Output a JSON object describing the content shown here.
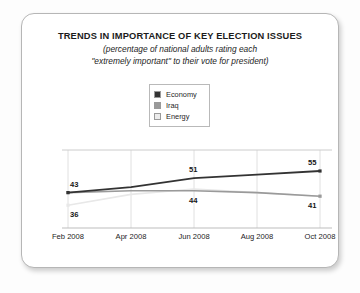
{
  "card": {
    "title": "TRENDS IN IMPORTANCE OF KEY ELECTION ISSUES",
    "subtitle_line1": "(percentage of national adults rating each",
    "subtitle_line2": "\"extremely important\" to their vote for president)"
  },
  "colors": {
    "economy": "#333333",
    "iraq": "#9a9a9a",
    "energy": "#e8e8e8",
    "gridline": "#e0e0e0",
    "axis": "#cccccc",
    "card_border": "#b6b6b6",
    "text": "#1b1b1b"
  },
  "chart_data": {
    "type": "line",
    "title": "TRENDS IN IMPORTANCE OF KEY ELECTION ISSUES",
    "subtitle": "(percentage of national adults rating each \"extremely important\" to their vote for president)",
    "xlabel": "",
    "ylabel": "",
    "ylim": [
      30,
      60
    ],
    "grid": true,
    "legend_position": "top-center",
    "categories": [
      "Feb 2008",
      "Apr 2008",
      "Jun 2008",
      "Aug 2008",
      "Oct 2008"
    ],
    "series": [
      {
        "name": "Economy",
        "color": "#333333",
        "values": [
          43,
          46,
          51,
          53,
          55
        ]
      },
      {
        "name": "Iraq",
        "color": "#9a9a9a",
        "values": [
          43,
          44,
          44,
          43,
          41
        ]
      },
      {
        "name": "Energy",
        "color": "#e8e8e8",
        "values": [
          36,
          42,
          45,
          43,
          41
        ]
      }
    ],
    "point_labels": [
      {
        "text": "43",
        "series": "Economy",
        "category": "Feb 2008",
        "position": "above"
      },
      {
        "text": "36",
        "series": "Energy",
        "category": "Feb 2008",
        "position": "below"
      },
      {
        "text": "51",
        "series": "Economy",
        "category": "Jun 2008",
        "position": "above"
      },
      {
        "text": "44",
        "series": "Iraq",
        "category": "Jun 2008",
        "position": "below"
      },
      {
        "text": "55",
        "series": "Economy",
        "category": "Oct 2008",
        "position": "above"
      },
      {
        "text": "41",
        "series": "Iraq",
        "category": "Oct 2008",
        "position": "below"
      }
    ]
  },
  "legend": {
    "items": [
      {
        "label": "Economy",
        "swatch": "#333333"
      },
      {
        "label": "Iraq",
        "swatch": "#9a9a9a"
      },
      {
        "label": "Energy",
        "swatch": "#ececec"
      }
    ]
  },
  "xaxis": {
    "ticks": [
      "Feb 2008",
      "Apr 2008",
      "Jun 2008",
      "Aug 2008",
      "Oct 2008"
    ]
  },
  "labels": {
    "left_top": "43",
    "left_bottom": "36",
    "mid_top": "51",
    "mid_bottom": "44",
    "right_top": "55",
    "right_bottom": "41"
  }
}
